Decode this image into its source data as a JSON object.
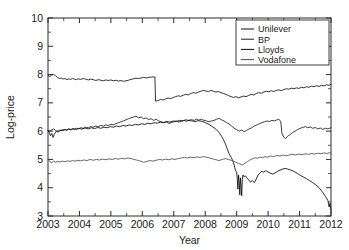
{
  "figure": {
    "name": "log-price-time-series",
    "background": "#ffffff"
  },
  "chart_data": {
    "type": "line",
    "title": "",
    "xlabel": "Year",
    "ylabel": "Log-price",
    "xlim": [
      2003.0,
      2012.0
    ],
    "ylim": [
      3,
      10
    ],
    "grid": false,
    "legend_position": "top-right",
    "x_ticks": [
      2003,
      2004,
      2005,
      2006,
      2007,
      2008,
      2009,
      2010,
      2011,
      2012
    ],
    "x_tick_labels": [
      "2003",
      "2004",
      "2005",
      "2006",
      "2007",
      "2008",
      "2009",
      "2010",
      "2011",
      "2012"
    ],
    "y_ticks": [
      3,
      4,
      5,
      6,
      7,
      8,
      9,
      10
    ],
    "y_tick_labels": [
      "3",
      "4",
      "5",
      "6",
      "7",
      "8",
      "9",
      "10"
    ],
    "y_minor_ticks": [
      3.5,
      4.5,
      5.5,
      6.5,
      7.5,
      8.5,
      9.5
    ],
    "x_minor_ticks": [
      2003.5,
      2004.5,
      2005.5,
      2006.5,
      2007.5,
      2008.5,
      2009.5,
      2010.5,
      2011.5
    ],
    "series": [
      {
        "name": "Unilever",
        "color": "#111111",
        "x": [
          2003.0,
          2003.06,
          2003.12,
          2003.18,
          2003.24,
          2003.3,
          2003.36,
          2003.42,
          2003.48,
          2003.54,
          2003.6,
          2003.66,
          2003.72,
          2003.78,
          2003.84,
          2003.9,
          2003.96,
          2004.04,
          2004.12,
          2004.2,
          2004.28,
          2004.36,
          2004.44,
          2004.52,
          2004.6,
          2004.68,
          2004.76,
          2004.84,
          2004.92,
          2005.0,
          2005.08,
          2005.16,
          2005.24,
          2005.32,
          2005.4,
          2005.48,
          2005.56,
          2005.64,
          2005.72,
          2005.8,
          2005.88,
          2005.96,
          2006.04,
          2006.12,
          2006.2,
          2006.28,
          2006.34,
          2006.38,
          2006.4,
          2006.42,
          2006.5,
          2006.58,
          2006.66,
          2006.74,
          2006.82,
          2006.9,
          2006.98,
          2007.06,
          2007.14,
          2007.22,
          2007.3,
          2007.38,
          2007.46,
          2007.54,
          2007.62,
          2007.7,
          2007.78,
          2007.86,
          2007.94,
          2008.02,
          2008.1,
          2008.18,
          2008.26,
          2008.34,
          2008.42,
          2008.5,
          2008.58,
          2008.66,
          2008.74,
          2008.82,
          2008.9,
          2008.98,
          2009.06,
          2009.14,
          2009.22,
          2009.3,
          2009.38,
          2009.46,
          2009.54,
          2009.62,
          2009.7,
          2009.78,
          2009.86,
          2009.94,
          2010.02,
          2010.1,
          2010.18,
          2010.26,
          2010.34,
          2010.42,
          2010.5,
          2010.58,
          2010.66,
          2010.74,
          2010.82,
          2010.9,
          2010.98,
          2011.06,
          2011.14,
          2011.22,
          2011.3,
          2011.38,
          2011.46,
          2011.54,
          2011.62,
          2011.7,
          2011.78,
          2011.86,
          2011.94,
          2012.0
        ],
        "y": [
          7.97,
          7.93,
          7.99,
          8.0,
          7.96,
          7.9,
          7.86,
          7.88,
          7.84,
          7.86,
          7.82,
          7.85,
          7.83,
          7.86,
          7.84,
          7.82,
          7.85,
          7.83,
          7.86,
          7.84,
          7.81,
          7.84,
          7.82,
          7.79,
          7.82,
          7.8,
          7.78,
          7.81,
          7.79,
          7.81,
          7.78,
          7.8,
          7.77,
          7.79,
          7.76,
          7.78,
          7.8,
          7.83,
          7.85,
          7.87,
          7.86,
          7.88,
          7.9,
          7.88,
          7.9,
          7.91,
          7.92,
          7.91,
          7.92,
          7.06,
          7.08,
          7.12,
          7.1,
          7.14,
          7.17,
          7.15,
          7.19,
          7.22,
          7.25,
          7.23,
          7.27,
          7.3,
          7.28,
          7.33,
          7.36,
          7.34,
          7.38,
          7.41,
          7.44,
          7.42,
          7.4,
          7.44,
          7.41,
          7.38,
          7.4,
          7.36,
          7.33,
          7.3,
          7.26,
          7.22,
          7.19,
          7.22,
          7.18,
          7.21,
          7.24,
          7.22,
          7.26,
          7.3,
          7.28,
          7.33,
          7.36,
          7.34,
          7.38,
          7.41,
          7.39,
          7.43,
          7.4,
          7.44,
          7.46,
          7.43,
          7.47,
          7.5,
          7.48,
          7.52,
          7.5,
          7.53,
          7.51,
          7.55,
          7.53,
          7.57,
          7.55,
          7.59,
          7.57,
          7.61,
          7.58,
          7.62,
          7.6,
          7.64,
          7.62,
          7.66
        ]
      },
      {
        "name": "BP",
        "color": "#1d1d1d",
        "x": [
          2003.0,
          2003.06,
          2003.12,
          2003.18,
          2003.24,
          2003.3,
          2003.36,
          2003.42,
          2003.48,
          2003.54,
          2003.6,
          2003.66,
          2003.72,
          2003.78,
          2003.84,
          2003.9,
          2003.96,
          2004.04,
          2004.12,
          2004.2,
          2004.28,
          2004.36,
          2004.44,
          2004.52,
          2004.6,
          2004.68,
          2004.76,
          2004.84,
          2004.92,
          2005.0,
          2005.08,
          2005.16,
          2005.24,
          2005.32,
          2005.4,
          2005.48,
          2005.56,
          2005.64,
          2005.72,
          2005.8,
          2005.88,
          2005.96,
          2006.04,
          2006.12,
          2006.2,
          2006.28,
          2006.36,
          2006.44,
          2006.52,
          2006.6,
          2006.68,
          2006.76,
          2006.84,
          2006.92,
          2007.0,
          2007.08,
          2007.16,
          2007.24,
          2007.32,
          2007.4,
          2007.48,
          2007.56,
          2007.64,
          2007.72,
          2007.8,
          2007.88,
          2007.96,
          2008.04,
          2008.12,
          2008.2,
          2008.28,
          2008.36,
          2008.44,
          2008.52,
          2008.6,
          2008.68,
          2008.76,
          2008.84,
          2008.92,
          2009.0,
          2009.08,
          2009.16,
          2009.24,
          2009.32,
          2009.4,
          2009.48,
          2009.56,
          2009.64,
          2009.72,
          2009.8,
          2009.88,
          2009.96,
          2010.04,
          2010.12,
          2010.2,
          2010.28,
          2010.34,
          2010.38,
          2010.4,
          2010.44,
          2010.5,
          2010.56,
          2010.62,
          2010.7,
          2010.78,
          2010.86,
          2010.94,
          2011.02,
          2011.1,
          2011.18,
          2011.26,
          2011.34,
          2011.42,
          2011.5,
          2011.58,
          2011.66,
          2011.74,
          2011.82,
          2011.9,
          2012.0
        ],
        "y": [
          6.03,
          6.0,
          6.05,
          6.08,
          6.02,
          5.97,
          5.99,
          6.04,
          6.01,
          6.06,
          6.03,
          6.07,
          6.05,
          6.09,
          6.06,
          6.1,
          6.08,
          6.12,
          6.1,
          6.14,
          6.12,
          6.16,
          6.14,
          6.18,
          6.16,
          6.2,
          6.18,
          6.22,
          6.2,
          6.24,
          6.22,
          6.26,
          6.3,
          6.33,
          6.36,
          6.4,
          6.44,
          6.47,
          6.5,
          6.53,
          6.47,
          6.5,
          6.44,
          6.47,
          6.41,
          6.44,
          6.38,
          6.42,
          6.36,
          6.33,
          6.3,
          6.33,
          6.27,
          6.3,
          6.33,
          6.36,
          6.32,
          6.35,
          6.38,
          6.35,
          6.38,
          6.41,
          6.38,
          6.42,
          6.39,
          6.42,
          6.38,
          6.36,
          6.33,
          6.36,
          6.38,
          6.42,
          6.45,
          6.4,
          6.36,
          6.3,
          6.25,
          6.18,
          6.1,
          6.05,
          6.0,
          6.04,
          5.98,
          6.03,
          6.08,
          6.12,
          6.18,
          6.22,
          6.26,
          6.3,
          6.33,
          6.36,
          6.34,
          6.38,
          6.36,
          6.4,
          6.42,
          6.38,
          6.35,
          5.92,
          5.78,
          5.74,
          5.82,
          5.88,
          5.95,
          6.0,
          6.06,
          6.1,
          6.13,
          6.16,
          6.12,
          6.15,
          6.1,
          6.13,
          6.08,
          6.11,
          6.06,
          6.1,
          6.08,
          6.12
        ]
      },
      {
        "name": "Lloyds",
        "color": "#0a0a0a",
        "x": [
          2003.0,
          2003.04,
          2003.08,
          2003.12,
          2003.16,
          2003.2,
          2003.24,
          2003.28,
          2003.32,
          2003.36,
          2003.42,
          2003.5,
          2003.58,
          2003.66,
          2003.74,
          2003.82,
          2003.9,
          2003.98,
          2004.08,
          2004.18,
          2004.28,
          2004.38,
          2004.48,
          2004.58,
          2004.68,
          2004.78,
          2004.88,
          2004.98,
          2005.08,
          2005.18,
          2005.28,
          2005.38,
          2005.48,
          2005.58,
          2005.68,
          2005.78,
          2005.88,
          2005.98,
          2006.08,
          2006.18,
          2006.28,
          2006.38,
          2006.48,
          2006.58,
          2006.68,
          2006.78,
          2006.88,
          2006.98,
          2007.08,
          2007.18,
          2007.28,
          2007.38,
          2007.48,
          2007.58,
          2007.68,
          2007.78,
          2007.88,
          2007.96,
          2008.04,
          2008.12,
          2008.2,
          2008.28,
          2008.36,
          2008.44,
          2008.52,
          2008.58,
          2008.64,
          2008.7,
          2008.76,
          2008.82,
          2008.88,
          2008.92,
          2008.96,
          2009.0,
          2009.02,
          2009.04,
          2009.06,
          2009.08,
          2009.1,
          2009.12,
          2009.14,
          2009.16,
          2009.18,
          2009.2,
          2009.24,
          2009.28,
          2009.32,
          2009.38,
          2009.44,
          2009.5,
          2009.56,
          2009.62,
          2009.68,
          2009.74,
          2009.8,
          2009.86,
          2009.92,
          2009.98,
          2010.06,
          2010.14,
          2010.22,
          2010.3,
          2010.38,
          2010.46,
          2010.54,
          2010.62,
          2010.7,
          2010.78,
          2010.86,
          2010.94,
          2011.02,
          2011.12,
          2011.22,
          2011.32,
          2011.42,
          2011.52,
          2011.62,
          2011.72,
          2011.82,
          2011.9,
          2011.94,
          2011.97,
          2012.0
        ],
        "y": [
          6.02,
          5.95,
          5.84,
          5.92,
          5.78,
          5.88,
          5.96,
          6.02,
          5.99,
          6.04,
          6.02,
          6.06,
          6.04,
          6.08,
          6.05,
          6.09,
          6.06,
          6.1,
          6.07,
          6.11,
          6.08,
          6.12,
          6.09,
          6.13,
          6.1,
          6.14,
          6.12,
          6.16,
          6.14,
          6.18,
          6.16,
          6.2,
          6.18,
          6.22,
          6.2,
          6.24,
          6.22,
          6.26,
          6.24,
          6.28,
          6.26,
          6.3,
          6.28,
          6.32,
          6.3,
          6.34,
          6.32,
          6.36,
          6.34,
          6.38,
          6.36,
          6.4,
          6.38,
          6.36,
          6.34,
          6.37,
          6.35,
          6.32,
          6.28,
          6.24,
          6.18,
          6.12,
          6.05,
          5.95,
          5.82,
          5.7,
          5.55,
          5.38,
          5.2,
          5.08,
          4.95,
          4.8,
          4.62,
          4.55,
          4.3,
          3.95,
          4.45,
          4.2,
          3.75,
          4.35,
          4.05,
          3.72,
          4.3,
          4.45,
          4.38,
          4.42,
          4.35,
          4.28,
          4.2,
          4.25,
          4.18,
          4.3,
          4.45,
          4.52,
          4.58,
          4.55,
          4.6,
          4.57,
          4.52,
          4.48,
          4.52,
          4.58,
          4.62,
          4.66,
          4.68,
          4.66,
          4.63,
          4.6,
          4.55,
          4.5,
          4.44,
          4.38,
          4.32,
          4.25,
          4.18,
          4.1,
          4.0,
          3.86,
          3.7,
          3.55,
          3.32,
          3.45,
          3.2
        ]
      },
      {
        "name": "Vodafone",
        "color": "#4d4d4d",
        "x": [
          2003.0,
          2003.06,
          2003.12,
          2003.18,
          2003.24,
          2003.3,
          2003.38,
          2003.46,
          2003.54,
          2003.62,
          2003.7,
          2003.78,
          2003.86,
          2003.94,
          2004.04,
          2004.14,
          2004.24,
          2004.34,
          2004.44,
          2004.54,
          2004.64,
          2004.74,
          2004.84,
          2004.94,
          2005.04,
          2005.14,
          2005.24,
          2005.34,
          2005.44,
          2005.54,
          2005.64,
          2005.74,
          2005.84,
          2005.94,
          2006.04,
          2006.14,
          2006.24,
          2006.34,
          2006.44,
          2006.54,
          2006.64,
          2006.74,
          2006.84,
          2006.94,
          2007.04,
          2007.14,
          2007.24,
          2007.34,
          2007.44,
          2007.54,
          2007.64,
          2007.74,
          2007.84,
          2007.94,
          2008.04,
          2008.14,
          2008.24,
          2008.34,
          2008.44,
          2008.54,
          2008.64,
          2008.74,
          2008.84,
          2008.94,
          2009.02,
          2009.1,
          2009.18,
          2009.26,
          2009.34,
          2009.42,
          2009.5,
          2009.58,
          2009.66,
          2009.74,
          2009.82,
          2009.9,
          2009.98,
          2010.08,
          2010.18,
          2010.28,
          2010.38,
          2010.48,
          2010.58,
          2010.68,
          2010.78,
          2010.88,
          2010.98,
          2011.08,
          2011.18,
          2011.28,
          2011.38,
          2011.48,
          2011.58,
          2011.68,
          2011.78,
          2011.88,
          2011.94,
          2012.0
        ],
        "y": [
          5.0,
          4.92,
          4.88,
          4.95,
          4.9,
          4.93,
          4.91,
          4.94,
          4.92,
          4.95,
          4.93,
          4.96,
          4.94,
          4.97,
          4.95,
          4.98,
          4.96,
          5.0,
          4.97,
          5.0,
          4.98,
          5.01,
          4.99,
          5.02,
          5.0,
          5.03,
          5.01,
          5.04,
          5.02,
          5.05,
          5.03,
          5.0,
          4.97,
          4.94,
          4.9,
          4.93,
          4.96,
          4.94,
          4.97,
          5.0,
          4.98,
          5.01,
          4.99,
          5.02,
          5.0,
          5.03,
          5.05,
          5.07,
          5.05,
          5.08,
          5.06,
          5.09,
          5.07,
          5.1,
          5.08,
          5.05,
          5.02,
          4.99,
          4.96,
          5.0,
          5.03,
          5.0,
          4.96,
          4.92,
          4.88,
          4.84,
          4.8,
          4.86,
          4.92,
          4.98,
          5.02,
          5.06,
          5.04,
          5.08,
          5.06,
          5.1,
          5.08,
          5.12,
          5.1,
          5.14,
          5.12,
          5.15,
          5.13,
          5.16,
          5.18,
          5.16,
          5.19,
          5.17,
          5.2,
          5.18,
          5.21,
          5.19,
          5.22,
          5.2,
          5.23,
          5.21,
          5.24,
          5.22
        ]
      }
    ]
  },
  "legend": {
    "entries": [
      {
        "label": "Unilever"
      },
      {
        "label": "BP"
      },
      {
        "label": "Lloyds"
      },
      {
        "label": "Vodafone"
      }
    ]
  }
}
